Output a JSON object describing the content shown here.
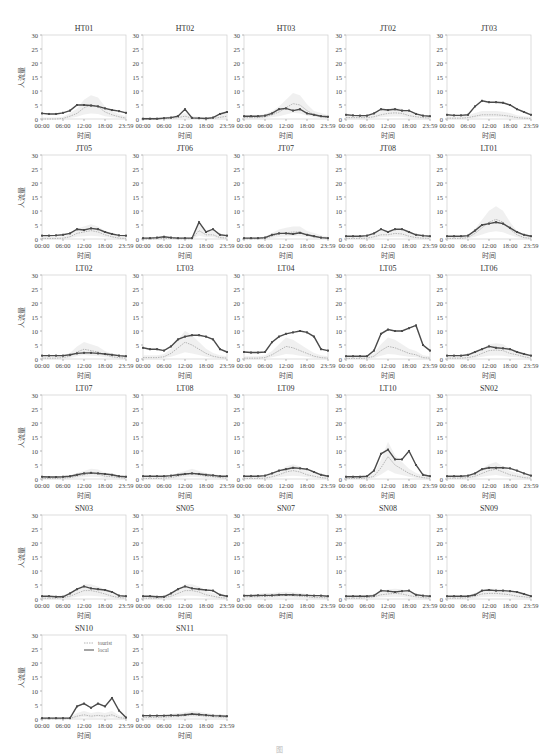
{
  "figure": {
    "ylabel": "人流量",
    "xlabel": "时间",
    "xticks": [
      "00:00",
      "06:00",
      "12:00",
      "18:00",
      "23:59"
    ],
    "yticks": [
      0,
      5,
      10,
      15,
      20,
      25,
      30
    ],
    "ylim": [
      0,
      30
    ],
    "legend": [
      {
        "label": "tourist",
        "color": "#b8b8b8",
        "style": "dotted"
      },
      {
        "label": "local",
        "color": "#555555",
        "style": "solid-marker"
      }
    ],
    "colors": {
      "local": "#4a4a4a",
      "tourist": "#b5b5b5",
      "band": "#e6e6e6",
      "frame": "#cfcfcf",
      "tick_text": "#444444"
    }
  },
  "chart_data": {
    "type": "line",
    "title": "",
    "xlabel": "时间",
    "ylabel": "人流量",
    "ylim": [
      0,
      30
    ],
    "grid": false,
    "legend_position": "upper right (SN10 panel)",
    "x_hours": [
      0,
      2,
      4,
      6,
      8,
      10,
      12,
      14,
      16,
      18,
      20,
      22,
      24
    ],
    "panels": [
      {
        "title": "HT01",
        "local": [
          2,
          1.8,
          1.8,
          2.2,
          3,
          5,
          5,
          4.8,
          4.5,
          3.8,
          3.2,
          2.8,
          2.2
        ],
        "tourist": [
          0,
          0,
          0,
          0.2,
          1,
          2,
          4,
          5,
          4.5,
          2.5,
          1.5,
          0.8,
          0.3
        ]
      },
      {
        "title": "HT02",
        "local": [
          0.1,
          0.1,
          0.1,
          0.3,
          0.5,
          1,
          3.5,
          0.4,
          0.3,
          0.2,
          0.5,
          1.8,
          2.5
        ],
        "tourist": [
          0,
          0,
          0,
          0.1,
          0.3,
          0.5,
          1,
          0.3,
          0.2,
          0.1,
          0.2,
          0.6,
          1
        ]
      },
      {
        "title": "HT03",
        "local": [
          1,
          1,
          1,
          1.2,
          2,
          3.5,
          3.8,
          3,
          3.5,
          2,
          1.5,
          1,
          0.8
        ],
        "tourist": [
          0.5,
          0.5,
          0.5,
          0.8,
          1.5,
          2.5,
          4,
          5.5,
          5,
          3,
          1.5,
          1,
          0.5
        ]
      },
      {
        "title": "JT02",
        "local": [
          1.5,
          1.3,
          1.2,
          1.2,
          2,
          3.5,
          3.2,
          3.5,
          3,
          3,
          1.8,
          1.2,
          1
        ],
        "tourist": [
          0.5,
          0.5,
          0.5,
          0.5,
          0.8,
          1.5,
          2,
          2.2,
          2,
          1.2,
          0.8,
          0.5,
          0.3
        ]
      },
      {
        "title": "JT03",
        "local": [
          1.5,
          1.3,
          1.3,
          1.5,
          4.5,
          6.5,
          6,
          6,
          5.8,
          5,
          3.5,
          2.5,
          1.5
        ],
        "tourist": [
          0.3,
          0.3,
          0.3,
          0.5,
          1,
          1.5,
          1.5,
          1.5,
          1.3,
          1,
          0.5,
          0.3,
          0.2
        ]
      },
      {
        "title": "JT05",
        "local": [
          1.2,
          1.2,
          1.3,
          1.5,
          2,
          3.5,
          3.2,
          3.8,
          3.5,
          2.5,
          1.8,
          1.3,
          1.2
        ],
        "tourist": [
          0.2,
          0.2,
          0.2,
          0.3,
          0.8,
          2,
          2.5,
          3,
          2.5,
          1.5,
          0.8,
          0.3,
          0.2
        ]
      },
      {
        "title": "JT06",
        "local": [
          0.3,
          0.3,
          0.5,
          0.8,
          0.5,
          0.3,
          0.3,
          0.3,
          6,
          2.5,
          3.5,
          1.5,
          1.2
        ],
        "tourist": [
          0,
          0,
          0.1,
          0.2,
          0.2,
          0.1,
          0.1,
          0.1,
          3,
          1.5,
          1.5,
          0.5,
          0.3
        ]
      },
      {
        "title": "JT07",
        "local": [
          0.3,
          0.3,
          0.3,
          0.5,
          1.5,
          2,
          2,
          1.8,
          2.2,
          1.5,
          1,
          0.5,
          0.3
        ],
        "tourist": [
          0.1,
          0.1,
          0.1,
          0.2,
          1,
          1.8,
          2.2,
          2.5,
          2.5,
          1.5,
          1,
          0.5,
          0.2
        ]
      },
      {
        "title": "JT08",
        "local": [
          1,
          1,
          1,
          1.2,
          2,
          3.5,
          2.5,
          3.5,
          3.5,
          2.5,
          1.5,
          1.2,
          1
        ],
        "tourist": [
          0.2,
          0.2,
          0.2,
          0.3,
          0.8,
          1.5,
          1.5,
          2,
          1.8,
          1,
          0.5,
          0.3,
          0.2
        ]
      },
      {
        "title": "LT01",
        "local": [
          1,
          1,
          1,
          1.2,
          3,
          5,
          5.5,
          6,
          5.5,
          4,
          2.5,
          1.5,
          1
        ],
        "tourist": [
          0.2,
          0.2,
          0.2,
          0.5,
          2,
          4,
          6,
          7,
          6,
          3.5,
          1.5,
          0.5,
          0.2
        ]
      },
      {
        "title": "LT02",
        "local": [
          1.2,
          1.2,
          1.2,
          1.2,
          1.5,
          2,
          2.2,
          2.2,
          2,
          1.8,
          1.5,
          1.2,
          1
        ],
        "tourist": [
          0.3,
          0.3,
          0.3,
          0.5,
          1,
          2.5,
          3.5,
          3,
          2.5,
          1.5,
          0.8,
          0.5,
          0.3
        ]
      },
      {
        "title": "LT03",
        "local": [
          4,
          3.5,
          3.5,
          3,
          4.5,
          7,
          8,
          8.5,
          8.5,
          8,
          7,
          3.5,
          2.5
        ],
        "tourist": [
          0.5,
          0.5,
          0.5,
          0.8,
          2,
          4,
          6,
          5,
          3.5,
          2,
          1,
          0.5,
          0.3
        ]
      },
      {
        "title": "LT04",
        "local": [
          2.5,
          2.3,
          2.3,
          2.5,
          6,
          8,
          9,
          9.5,
          10,
          9.5,
          8,
          3.5,
          3
        ],
        "tourist": [
          0.3,
          0.3,
          0.3,
          0.5,
          1.5,
          3,
          4.5,
          4,
          3,
          2,
          1,
          0.5,
          0.3
        ]
      },
      {
        "title": "LT05",
        "local": [
          1,
          1,
          1,
          1,
          3,
          9,
          10.5,
          10,
          10,
          11,
          12,
          5,
          3
        ],
        "tourist": [
          0.2,
          0.2,
          0.2,
          0.3,
          1,
          3,
          4.5,
          4,
          3,
          2,
          1.5,
          0.5,
          0.3
        ]
      },
      {
        "title": "LT06",
        "local": [
          1.2,
          1.2,
          1.2,
          1.5,
          2.5,
          3.5,
          4.5,
          4,
          3.8,
          3.5,
          2.5,
          1.8,
          1.2
        ],
        "tourist": [
          0.3,
          0.3,
          0.3,
          0.5,
          1,
          2,
          3,
          3.2,
          3,
          2,
          1.5,
          0.8,
          0.3
        ]
      },
      {
        "title": "LT07",
        "local": [
          0.8,
          0.7,
          0.7,
          0.8,
          1,
          1.5,
          2,
          2.2,
          2,
          1.8,
          1.5,
          1,
          0.8
        ],
        "tourist": [
          0.2,
          0.2,
          0.2,
          0.3,
          0.5,
          1,
          1.5,
          2,
          1.8,
          1,
          0.8,
          0.5,
          0.2
        ]
      },
      {
        "title": "LT08",
        "local": [
          1,
          1,
          1,
          1,
          1.2,
          1.5,
          1.8,
          2,
          1.8,
          1.5,
          1.3,
          1,
          1
        ],
        "tourist": [
          0.2,
          0.2,
          0.2,
          0.3,
          0.5,
          1,
          1.5,
          2,
          1.5,
          1,
          0.8,
          0.5,
          0.3
        ]
      },
      {
        "title": "LT09",
        "local": [
          1,
          1,
          1,
          1.2,
          2,
          3,
          3.5,
          4,
          3.8,
          3.5,
          2.5,
          1.5,
          1
        ],
        "tourist": [
          0.2,
          0.2,
          0.2,
          0.3,
          0.8,
          1.5,
          2.5,
          3,
          2.5,
          1.5,
          1,
          0.5,
          0.2
        ]
      },
      {
        "title": "LT10",
        "local": [
          0.8,
          0.8,
          0.8,
          1,
          3,
          9,
          10.5,
          7,
          7,
          10,
          5,
          1.5,
          1
        ],
        "tourist": [
          0.2,
          0.2,
          0.2,
          0.3,
          1,
          4,
          8,
          5,
          3.5,
          2,
          1,
          0.5,
          0.2
        ]
      },
      {
        "title": "SN02",
        "local": [
          1,
          1,
          1,
          1.2,
          2,
          3.5,
          4,
          4,
          4,
          3.8,
          3,
          2,
          1.2
        ],
        "tourist": [
          0.3,
          0.3,
          0.3,
          0.5,
          1,
          2,
          3,
          3.5,
          2.5,
          1.5,
          1,
          0.5,
          0.3
        ]
      },
      {
        "title": "SN03",
        "local": [
          1,
          1,
          0.8,
          0.8,
          2,
          3.5,
          4.5,
          3.8,
          3.5,
          3.2,
          2.5,
          1.2,
          1
        ],
        "tourist": [
          0.3,
          0.3,
          0.3,
          0.5,
          1,
          2,
          3,
          3,
          2.5,
          1.8,
          1,
          0.5,
          0.3
        ]
      },
      {
        "title": "SN05",
        "local": [
          1,
          1,
          0.8,
          0.8,
          2,
          3.5,
          4.5,
          3.8,
          3.5,
          3.2,
          3,
          1.5,
          1
        ],
        "tourist": [
          0.3,
          0.3,
          0.3,
          0.5,
          1,
          2,
          3,
          3,
          2.5,
          1.5,
          1,
          0.5,
          0.3
        ]
      },
      {
        "title": "SN07",
        "local": [
          1.2,
          1.2,
          1.3,
          1.3,
          1.3,
          1.5,
          1.5,
          1.5,
          1.4,
          1.3,
          1.2,
          1.2,
          1
        ],
        "tourist": [
          0.8,
          0.8,
          0.8,
          1,
          1,
          1.2,
          1.3,
          1.2,
          1,
          0.8,
          0.5,
          0.5,
          0.4
        ]
      },
      {
        "title": "SN08",
        "local": [
          1,
          1,
          1,
          1,
          1.2,
          3,
          2.8,
          2.5,
          2.8,
          3,
          1.5,
          1.2,
          1
        ],
        "tourist": [
          0.3,
          0.3,
          0.3,
          0.5,
          0.8,
          1.5,
          1.8,
          2,
          1.8,
          1.2,
          0.8,
          0.5,
          0.3
        ]
      },
      {
        "title": "SN09",
        "local": [
          1,
          1,
          1,
          1,
          1.5,
          3,
          3.2,
          3,
          3,
          2.8,
          2.5,
          1.8,
          1
        ],
        "tourist": [
          0.3,
          0.3,
          0.3,
          0.5,
          1,
          1.8,
          2,
          2,
          1.8,
          1.5,
          1,
          0.8,
          0.4
        ]
      },
      {
        "title": "SN10",
        "local": [
          0.3,
          0.3,
          0.3,
          0.3,
          0.3,
          4.5,
          5.5,
          4,
          5.5,
          4.5,
          7.5,
          3,
          0.5
        ],
        "tourist": [
          0.1,
          0.1,
          0.1,
          0.1,
          0.2,
          1,
          1.5,
          1,
          1.3,
          1,
          1.5,
          0.5,
          0.2
        ]
      },
      {
        "title": "SN11",
        "local": [
          1.2,
          1.2,
          1.2,
          1.2,
          1.3,
          1.3,
          1.5,
          1.8,
          1.6,
          1.4,
          1.2,
          1.1,
          1
        ],
        "tourist": [
          0.6,
          0.6,
          0.6,
          0.7,
          0.8,
          1,
          1.2,
          1.5,
          1.3,
          1,
          0.8,
          0.7,
          0.6
        ]
      }
    ]
  },
  "caption": "图"
}
